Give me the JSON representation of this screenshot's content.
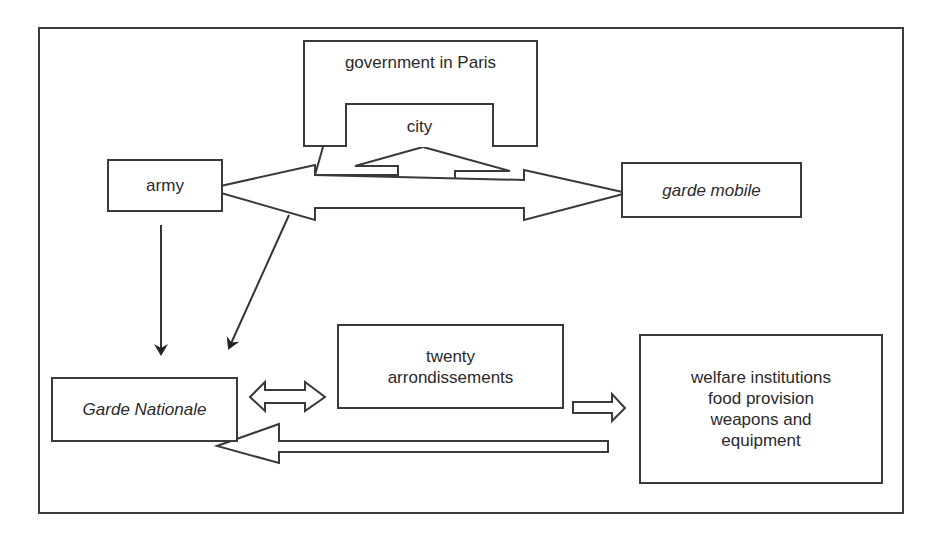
{
  "diagram": {
    "type": "organizational-relationship-diagram",
    "colors": {
      "stroke": "#3a3a3a",
      "background": "#ffffff",
      "text": "#2a2a2a"
    },
    "nodes": {
      "government": {
        "label": "government in Paris"
      },
      "city": {
        "label": "city"
      },
      "army": {
        "label": "army"
      },
      "garde_mobile": {
        "label": "garde mobile",
        "style": "italic"
      },
      "twenty_arrondissements": {
        "lines": [
          "twenty",
          "arrondissements"
        ]
      },
      "garde_nationale": {
        "label": "Garde Nationale",
        "style": "italic"
      },
      "welfare": {
        "lines": [
          "welfare institutions",
          "food provision",
          "weapons and",
          "equipment"
        ]
      }
    },
    "edges": [
      {
        "from": "city",
        "to": "army",
        "kind": "block-arrow"
      },
      {
        "from": "city",
        "to": "garde_mobile",
        "kind": "block-arrow"
      },
      {
        "from": "army",
        "to": "garde_mobile",
        "kind": "double-block-arrow"
      },
      {
        "from": "army",
        "to": "garde_nationale",
        "kind": "line-arrow"
      },
      {
        "from": "army-mobile-arrow",
        "to": "garde_nationale",
        "kind": "line-arrow"
      },
      {
        "from": "garde_nationale",
        "to": "twenty_arrondissements",
        "kind": "double-block-arrow"
      },
      {
        "from": "twenty_arrondissements",
        "to": "welfare",
        "kind": "block-arrow"
      },
      {
        "from": "welfare",
        "to": "garde_nationale",
        "kind": "block-arrow"
      }
    ]
  }
}
